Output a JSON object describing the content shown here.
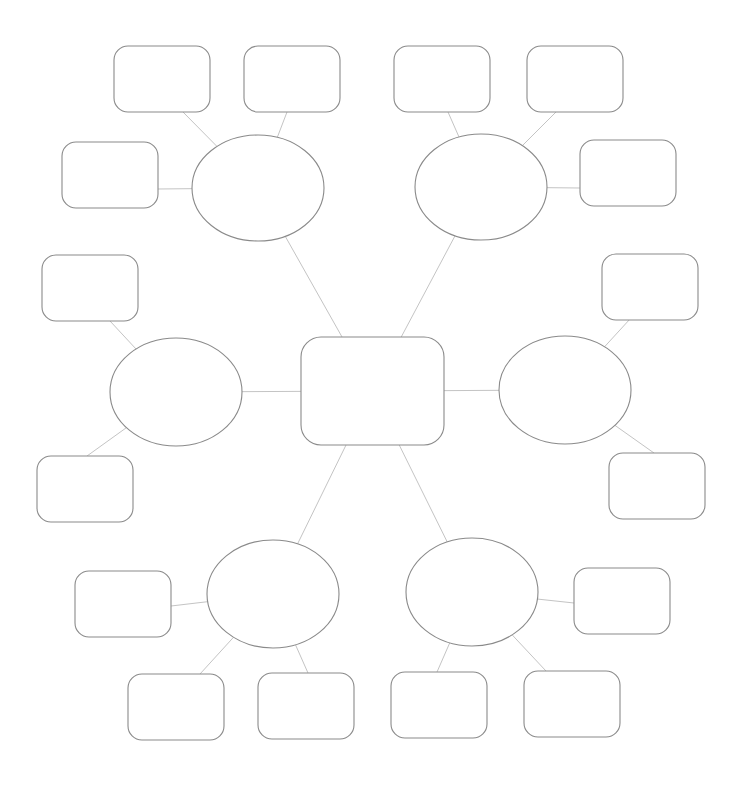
{
  "diagram": {
    "type": "mind-map",
    "colors": {
      "connector": "#c4c4c4",
      "stroke": "#8a8a8a",
      "background": "#ffffff"
    },
    "center": {
      "id": "center",
      "x": 301,
      "y": 337,
      "w": 143,
      "h": 108,
      "r": 20,
      "label": ""
    },
    "branches": [
      {
        "id": "branch-top-left",
        "cx": 258,
        "cy": 188,
        "rx": 66,
        "ry": 53,
        "label": "",
        "leaves": [
          {
            "id": "leaf-tl-1",
            "x": 114,
            "y": 46,
            "w": 96,
            "h": 66,
            "label": "",
            "ax": 183,
            "ay": 112
          },
          {
            "id": "leaf-tl-2",
            "x": 244,
            "y": 46,
            "w": 96,
            "h": 66,
            "label": "",
            "ax": 287,
            "ay": 112
          },
          {
            "id": "leaf-tl-3",
            "x": 62,
            "y": 142,
            "w": 96,
            "h": 66,
            "label": "",
            "ax": 158,
            "ay": 189
          }
        ]
      },
      {
        "id": "branch-top-right",
        "cx": 481,
        "cy": 187,
        "rx": 66,
        "ry": 53,
        "label": "",
        "leaves": [
          {
            "id": "leaf-tr-1",
            "x": 394,
            "y": 46,
            "w": 96,
            "h": 66,
            "label": "",
            "ax": 448,
            "ay": 112
          },
          {
            "id": "leaf-tr-2",
            "x": 527,
            "y": 46,
            "w": 96,
            "h": 66,
            "label": "",
            "ax": 556,
            "ay": 112
          },
          {
            "id": "leaf-tr-3",
            "x": 580,
            "y": 140,
            "w": 96,
            "h": 66,
            "label": "",
            "ax": 580,
            "ay": 188
          }
        ]
      },
      {
        "id": "branch-left",
        "cx": 176,
        "cy": 392,
        "rx": 66,
        "ry": 54,
        "label": "",
        "leaves": [
          {
            "id": "leaf-l-1",
            "x": 42,
            "y": 255,
            "w": 96,
            "h": 66,
            "label": "",
            "ax": 110,
            "ay": 321
          },
          {
            "id": "leaf-l-2",
            "x": 37,
            "y": 456,
            "w": 96,
            "h": 66,
            "label": "",
            "ax": 87,
            "ay": 456
          }
        ]
      },
      {
        "id": "branch-right",
        "cx": 565,
        "cy": 390,
        "rx": 66,
        "ry": 54,
        "label": "",
        "leaves": [
          {
            "id": "leaf-r-1",
            "x": 602,
            "y": 254,
            "w": 96,
            "h": 66,
            "label": "",
            "ax": 630,
            "ay": 319
          },
          {
            "id": "leaf-r-2",
            "x": 609,
            "y": 453,
            "w": 96,
            "h": 66,
            "label": "",
            "ax": 654,
            "ay": 453
          }
        ]
      },
      {
        "id": "branch-bottom-left",
        "cx": 273,
        "cy": 594,
        "rx": 66,
        "ry": 54,
        "label": "",
        "leaves": [
          {
            "id": "leaf-bl-1",
            "x": 75,
            "y": 571,
            "w": 96,
            "h": 66,
            "label": "",
            "ax": 171,
            "ay": 606
          },
          {
            "id": "leaf-bl-2",
            "x": 128,
            "y": 674,
            "w": 96,
            "h": 66,
            "label": "",
            "ax": 200,
            "ay": 674
          },
          {
            "id": "leaf-bl-3",
            "x": 258,
            "y": 673,
            "w": 96,
            "h": 66,
            "label": "",
            "ax": 308,
            "ay": 673
          }
        ]
      },
      {
        "id": "branch-bottom-right",
        "cx": 472,
        "cy": 592,
        "rx": 66,
        "ry": 54,
        "label": "",
        "leaves": [
          {
            "id": "leaf-br-1",
            "x": 574,
            "y": 568,
            "w": 96,
            "h": 66,
            "label": "",
            "ax": 574,
            "ay": 603
          },
          {
            "id": "leaf-br-2",
            "x": 391,
            "y": 672,
            "w": 96,
            "h": 66,
            "label": "",
            "ax": 437,
            "ay": 672
          },
          {
            "id": "leaf-br-3",
            "x": 524,
            "y": 671,
            "w": 96,
            "h": 66,
            "label": "",
            "ax": 546,
            "ay": 671
          }
        ]
      }
    ]
  }
}
